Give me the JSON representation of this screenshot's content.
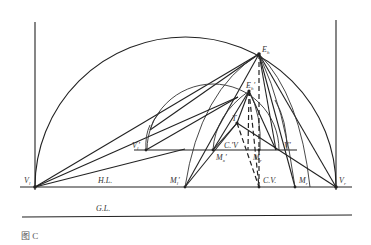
{
  "caption": "图 C",
  "labels": {
    "eh": "E",
    "eh_sub": "h",
    "eh_prime": "E",
    "eh_prime_sub": "h",
    "eh_prime_mark": "′",
    "t": "T",
    "vl_prime": "V",
    "vl_prime_sub": "l",
    "vl_prime_mark": "′",
    "cv_prime": "C.′V",
    "vr_prime": "V′",
    "mx_prime": "M",
    "mx_prime_sub": "x",
    "mx_prime_mark": "′",
    "m_center": "M",
    "m_center_sub": "r",
    "vl": "V",
    "vl_sub": "l",
    "hl": "H.L.",
    "ml_prime": "M",
    "ml_prime_sub": "l",
    "ml_prime_mark": "′",
    "cv": "C.V.",
    "mr": "M",
    "mr_sub": "r",
    "vr": "V",
    "vr_sub": "r",
    "gl": "G.L."
  },
  "colors": {
    "line": "#222222",
    "text": "#333333",
    "background": "#ffffff"
  }
}
